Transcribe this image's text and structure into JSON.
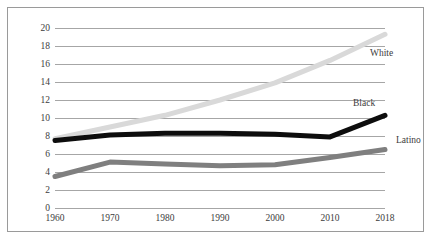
{
  "chart_data": {
    "type": "line",
    "title": "",
    "xlabel": "",
    "ylabel": "",
    "x": [
      1960,
      1970,
      1980,
      1990,
      2000,
      2010,
      2018
    ],
    "categories": [
      "1960",
      "1970",
      "1980",
      "1990",
      "2000",
      "2010",
      "2018"
    ],
    "xlim": [
      1960,
      2018
    ],
    "ylim": [
      0,
      20
    ],
    "ytick_values": [
      0,
      2,
      4,
      6,
      8,
      10,
      12,
      14,
      16,
      18,
      20
    ],
    "ytick_labels": [
      "0",
      "2",
      "4",
      "6",
      "8",
      "10",
      "12",
      "14",
      "16",
      "18",
      "20"
    ],
    "grid": "horizontal",
    "legend": "inline-right-of-line-end",
    "series": [
      {
        "name": "White",
        "label": "White",
        "color": "#d9d9d9",
        "values": [
          7.7,
          9.0,
          10.3,
          12.0,
          13.9,
          16.4,
          19.3
        ]
      },
      {
        "name": "Black",
        "label": "Black",
        "color": "#0d0d0d",
        "values": [
          7.5,
          8.1,
          8.3,
          8.3,
          8.2,
          7.9,
          10.3
        ]
      },
      {
        "name": "Latino",
        "label": "Latino",
        "color": "#7f7f7f",
        "values": [
          3.5,
          5.1,
          4.9,
          4.7,
          4.8,
          5.6,
          6.5
        ]
      }
    ]
  },
  "colors": {
    "frame": "#9a9a9a",
    "gridline": "#a6a6a6",
    "text": "#3c3c3c",
    "background": "#ffffff"
  }
}
